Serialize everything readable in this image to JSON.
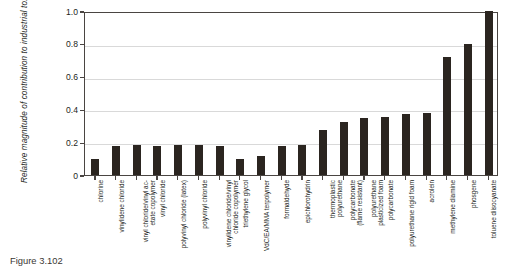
{
  "figure": {
    "caption": "Figure 3.102"
  },
  "chart_data": {
    "type": "bar",
    "title": "",
    "xlabel": "",
    "ylabel": "Relative magnitude of contribution to industrial toxicity",
    "ylim": [
      0,
      1.0
    ],
    "yticks": [
      "0",
      "0.2",
      "0.4",
      "0.6",
      "0.8",
      "1.0"
    ],
    "ytick_values": [
      0,
      0.2,
      0.4,
      0.6,
      0.8,
      1.0
    ],
    "grid": true,
    "legend": "none",
    "bar_color": "#2b2520",
    "axis_color": "#4a4542",
    "grid_color": "#d9d9d9",
    "categories": [
      "chlorine",
      "vinylidene chloride",
      "vinyl chloride/vinyl ac-etate copolymer",
      "vinyl chloride",
      "polyvinyl chloride (latex)",
      "polyvinyl chloride",
      "vinylidene chloride/vinyl chloride copolymer",
      "triethylene glycol",
      "VdC/EA/MMA terpolymer",
      "formaldehyde",
      "epichlorohydrin",
      "thermoplastic polyurethane",
      "polycarbonate (flame resistant)",
      "polyurethane plasticized foam",
      "polycarbonate",
      "polyurethane rigid foam",
      "acrolein",
      "methylene diamine",
      "phosgene",
      "toluene diisocyanate"
    ],
    "category_lines": [
      [
        "chlorine",
        ""
      ],
      [
        "vinylidene chloride",
        ""
      ],
      [
        "vinyl  chloride/vinyl  ac-",
        "etate copolymer"
      ],
      [
        "vinyl chloride",
        ""
      ],
      [
        "polyvinyl chloride (latex)",
        ""
      ],
      [
        "polyvinyl chloride",
        ""
      ],
      [
        "vinylidene  chloride/vinyl",
        "chloride copolymer"
      ],
      [
        "triethylene glycol",
        ""
      ],
      [
        "VdC/EA/MMA terpolymer",
        ""
      ],
      [
        "formaldehyde",
        ""
      ],
      [
        "epichlorohydrin",
        ""
      ],
      [
        "thermoplastic",
        "polyurethane"
      ],
      [
        "polycarbonate",
        "(flame resistant)"
      ],
      [
        "polyurethane",
        "plasticized foam"
      ],
      [
        "polycarbonate",
        ""
      ],
      [
        "polyurethane rigid foam",
        ""
      ],
      [
        "acrolein",
        ""
      ],
      [
        "methylene diamine",
        ""
      ],
      [
        "phosgene",
        ""
      ],
      [
        "toluene diisocyanate",
        ""
      ]
    ],
    "values": [
      0.1,
      0.175,
      0.18,
      0.175,
      0.18,
      0.185,
      0.175,
      0.1,
      0.115,
      0.175,
      0.18,
      0.275,
      0.325,
      0.35,
      0.355,
      0.375,
      0.38,
      0.72,
      0.8,
      1.0
    ]
  }
}
